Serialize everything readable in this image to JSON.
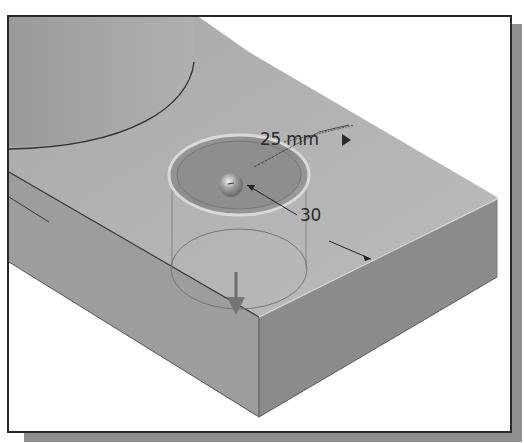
{
  "viewport": {
    "name": "3D modeling viewport",
    "background": "#ffffff"
  },
  "model": {
    "parts": [
      "cylinder-boss",
      "rectangular-base-block"
    ],
    "hole_preview": {
      "diameter_dimension": "25 mm",
      "offset_dimension": "30",
      "direction_arrow": "down"
    }
  },
  "dimensions": {
    "diameter": {
      "value": "25 mm",
      "has_flyout_arrow": true
    },
    "distance": {
      "value": "30"
    }
  },
  "colors": {
    "top_face": "#b4b4b4",
    "front_face": "#9c9c9c",
    "side_face": "#8a8a8a",
    "cylinder": "#a2a2a2",
    "frame_border": "#2a2a2a",
    "shadow": "#8f8f8f"
  }
}
